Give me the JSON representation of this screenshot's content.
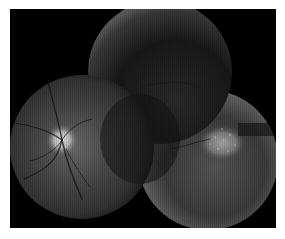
{
  "image": {
    "kind": "fundus-photograph-montage",
    "description": "Grayscale wide-field retinal montage composed of three overlapping circular fundus fields on a black background",
    "background_color": "#ffffff",
    "frame_color": "#000000",
    "fields": [
      {
        "name": "left-field",
        "cx": 72,
        "cy": 138,
        "r": 72,
        "tone": "#3a3a3a"
      },
      {
        "name": "upper-center-field",
        "cx": 150,
        "cy": 63,
        "r": 72,
        "tone": "#1c1c1c"
      },
      {
        "name": "lower-right-field",
        "cx": 198,
        "cy": 151,
        "r": 70,
        "tone": "#2e2e2e"
      }
    ],
    "features": {
      "optic_disc": {
        "cx": 52,
        "cy": 131,
        "r": 12,
        "color": "#d8d8d8"
      },
      "bright_lesion": {
        "cx": 212,
        "cy": 134,
        "rx": 22,
        "ry": 16,
        "color": "#9a9a9a"
      },
      "dark_band": {
        "x": 228,
        "y": 116,
        "w": 40,
        "h": 12,
        "color": "#1a1a1a"
      }
    }
  }
}
